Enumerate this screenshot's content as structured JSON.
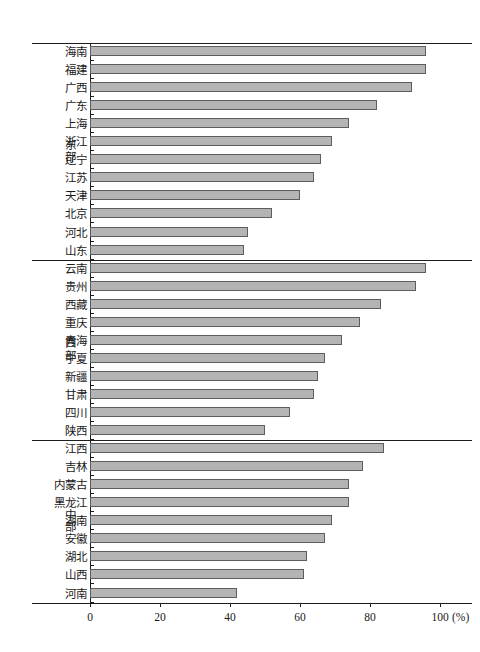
{
  "chart_data": {
    "type": "bar",
    "orientation": "horizontal",
    "title": "",
    "xlabel": "(%)",
    "ylabel": "",
    "xlim": [
      0,
      100
    ],
    "xticks": [
      0,
      20,
      40,
      60,
      80,
      100
    ],
    "xtick_labels": [
      "0",
      "20",
      "40",
      "60",
      "80",
      "100"
    ],
    "x_unit_label": "(%)",
    "grid": false,
    "legend": false,
    "groups": [
      {
        "name": "东部",
        "name_chars": [
          "东",
          "部"
        ],
        "categories": [
          "海南",
          "福建",
          "广西",
          "广东",
          "上海",
          "浙江",
          "辽宁",
          "江苏",
          "天津",
          "北京",
          "河北",
          "山东"
        ],
        "values": [
          96,
          96,
          92,
          82,
          74,
          69,
          66,
          64,
          60,
          52,
          45,
          44
        ]
      },
      {
        "name": "西部",
        "name_chars": [
          "西",
          "部"
        ],
        "categories": [
          "云南",
          "贵州",
          "西藏",
          "重庆",
          "青海",
          "宁夏",
          "新疆",
          "甘肃",
          "四川",
          "陕西"
        ],
        "values": [
          96,
          93,
          83,
          77,
          72,
          67,
          65,
          64,
          57,
          50
        ]
      },
      {
        "name": "中部",
        "name_chars": [
          "中",
          "部"
        ],
        "categories": [
          "江西",
          "吉林",
          "内蒙古",
          "黑龙江",
          "湖南",
          "安徽",
          "湖北",
          "山西",
          "河南"
        ],
        "values": [
          84,
          78,
          74,
          74,
          69,
          67,
          62,
          61,
          42
        ]
      }
    ],
    "colors": {
      "bar_fill": "#b4b4b4",
      "bar_border": "#5d5d5d",
      "axis": "#1d1d1d",
      "text": "#1a1a1a",
      "background": "#ffffff"
    }
  }
}
